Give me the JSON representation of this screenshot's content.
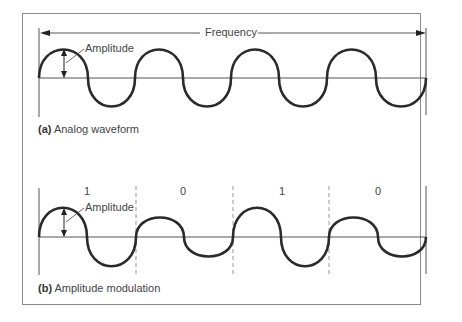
{
  "panel_a": {
    "frequency_label": "Frequency",
    "amplitude_label": "Amplitude",
    "caption_letter": "(a)",
    "caption_text": "Analog waveform"
  },
  "panel_b": {
    "amplitude_label": "Amplitude",
    "caption_letter": "(b)",
    "caption_text": "Amplitude modulation",
    "bits": [
      "1",
      "0",
      "1",
      "0"
    ]
  },
  "colors": {
    "wave": "#2a2a2a",
    "axis": "#555555",
    "frame": "#8a8a8a",
    "dashed": "#999999"
  }
}
